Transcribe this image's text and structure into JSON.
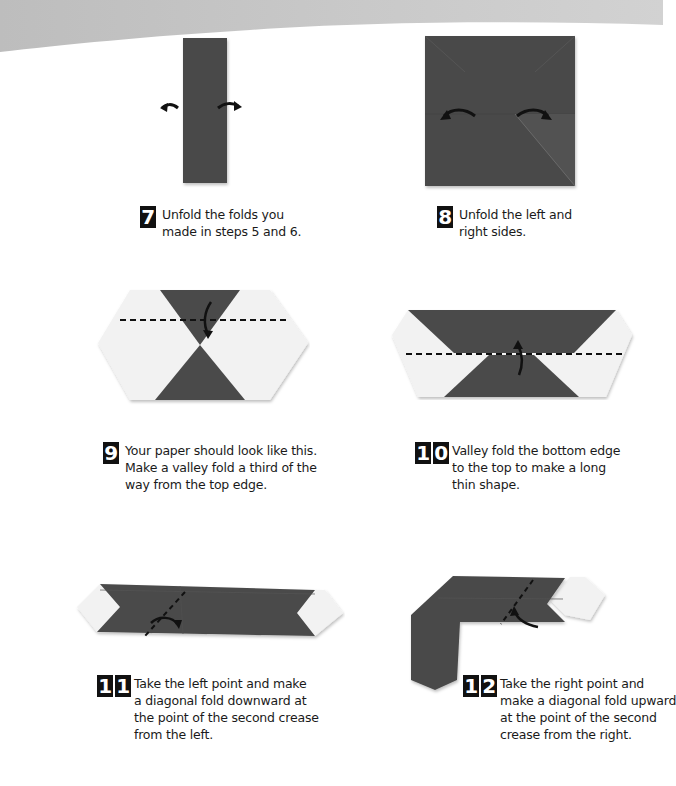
{
  "colors": {
    "paper_dark": "#4a4a4a",
    "paper_light": "#f2f2f2",
    "page_curve": "#cfcfcf",
    "badge_bg": "#111111",
    "text": "#1a1a1a"
  },
  "steps": [
    {
      "number": "7",
      "digits": [
        "7"
      ],
      "lines": [
        "Unfold the folds you",
        "made in steps 5 and 6."
      ],
      "diagram": "narrow-strip-unfold-arrows"
    },
    {
      "number": "8",
      "digits": [
        "8"
      ],
      "lines": [
        "Unfold the left and",
        "right sides."
      ],
      "diagram": "square-unfold-arrows"
    },
    {
      "number": "9",
      "digits": [
        "9"
      ],
      "lines": [
        "Your paper should look like this.",
        "Make a valley fold a third of the",
        "way from the top edge."
      ],
      "diagram": "hexagon-valley-fold-line"
    },
    {
      "number": "10",
      "digits": [
        "1",
        "0"
      ],
      "lines": [
        "Valley fold the bottom edge",
        "to the top to make a long",
        "thin shape."
      ],
      "diagram": "trapezoid-valley-fold-line"
    },
    {
      "number": "11",
      "digits": [
        "1",
        "1"
      ],
      "lines": [
        "Take the left point and make",
        "a diagonal fold downward at",
        "the point of the second crease",
        "from the left."
      ],
      "diagram": "long-strip-diagonal-fold"
    },
    {
      "number": "12",
      "digits": [
        "1",
        "2"
      ],
      "lines": [
        "Take the right point and",
        "make a diagonal fold upward",
        "at the point of the second",
        "crease from the right."
      ],
      "diagram": "l-shape-diagonal-fold"
    }
  ]
}
